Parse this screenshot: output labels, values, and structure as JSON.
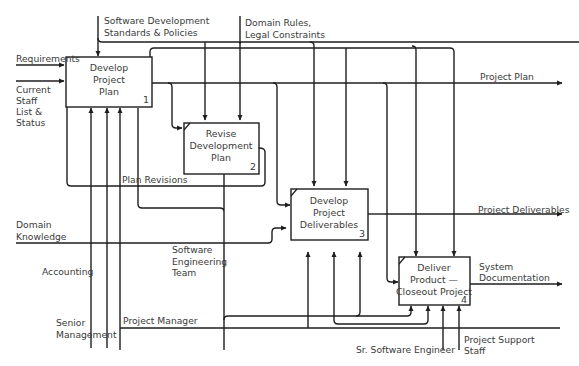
{
  "diagram": {
    "type": "IDEF0",
    "boxes": [
      {
        "id": 1,
        "number": "1",
        "lines": [
          "Develop",
          "Project",
          "Plan"
        ]
      },
      {
        "id": 2,
        "number": "2",
        "lines": [
          "Revise",
          "Development",
          "Plan"
        ]
      },
      {
        "id": 3,
        "number": "3",
        "lines": [
          "Develop",
          "Project",
          "Deliverables"
        ]
      },
      {
        "id": 4,
        "number": "4",
        "lines": [
          "Deliver",
          "Product —",
          "Closeout Project"
        ]
      }
    ],
    "inputs": {
      "requirements": "Requirements",
      "current_staff": [
        "Current",
        "Staff",
        "List &",
        "Status"
      ],
      "domain_knowledge": [
        "Domain",
        "Knowledge"
      ]
    },
    "controls": {
      "standards": [
        "Software Development",
        "Standards & Policies"
      ],
      "domain_rules": [
        "Domain Rules,",
        "Legal Constraints"
      ]
    },
    "outputs": {
      "project_plan": "Project Plan",
      "project_deliverables": "Project Deliverables",
      "system_documentation": [
        "System",
        "Documentation"
      ],
      "plan_revisions": "Plan Revisions"
    },
    "mechanisms": {
      "accounting": "Accounting",
      "senior_management": [
        "Senior",
        "Management"
      ],
      "project_manager": "Project Manager",
      "software_engineering_team": [
        "Software",
        "Engineering",
        "Team"
      ],
      "sr_software_engineer": "Sr. Software Engineer",
      "project_support_staff": [
        "Project Support",
        "Staff"
      ]
    },
    "colors": {
      "line": "#1e1e1e",
      "text": "#3a3a3a",
      "background": "#ffffff"
    }
  }
}
